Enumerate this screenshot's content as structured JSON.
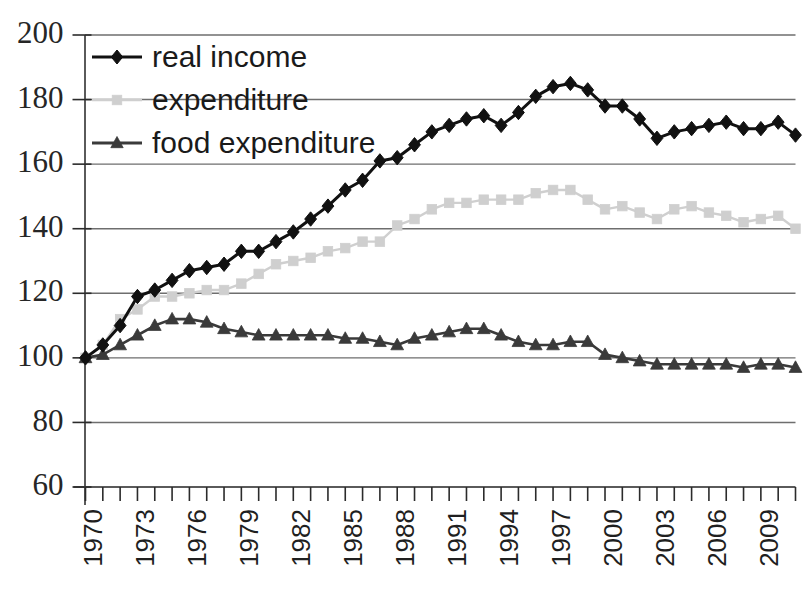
{
  "chart_data": {
    "type": "line",
    "title": "",
    "subtitle": "",
    "xlabel": "",
    "ylabel": "",
    "xlim": [
      1970,
      2011
    ],
    "ylim": [
      60,
      200
    ],
    "ytick_step": 20,
    "yticks": [
      60,
      80,
      100,
      120,
      140,
      160,
      180,
      200
    ],
    "ytick_labels": [
      "60",
      "80",
      "100",
      "120",
      "140",
      "160",
      "180",
      "200"
    ],
    "grid": true,
    "grid_axis": "y",
    "legend_position": "top-left",
    "x": [
      1970,
      1971,
      1972,
      1973,
      1974,
      1975,
      1976,
      1977,
      1978,
      1979,
      1980,
      1981,
      1982,
      1983,
      1984,
      1985,
      1986,
      1987,
      1988,
      1989,
      1990,
      1991,
      1992,
      1993,
      1994,
      1995,
      1996,
      1997,
      1998,
      1999,
      2000,
      2001,
      2002,
      2003,
      2004,
      2005,
      2006,
      2007,
      2008,
      2009,
      2010,
      2011
    ],
    "xticks": [
      1970,
      1971,
      1972,
      1973,
      1974,
      1975,
      1976,
      1977,
      1978,
      1979,
      1980,
      1981,
      1982,
      1983,
      1984,
      1985,
      1986,
      1987,
      1988,
      1989,
      1990,
      1991,
      1992,
      1993,
      1994,
      1995,
      1996,
      1997,
      1998,
      1999,
      2000,
      2001,
      2002,
      2003,
      2004,
      2005,
      2006,
      2007,
      2008,
      2009,
      2010,
      2011
    ],
    "xtick_labels_shown": [
      "1970",
      "1973",
      "1976",
      "1979",
      "1982",
      "1985",
      "1988",
      "1991",
      "1994",
      "1997",
      "2000",
      "2003",
      "2006",
      "2009"
    ],
    "xtick_label_interval": 3,
    "xtick_label_rotation": -90,
    "series": [
      {
        "name": "real income",
        "color": "#111111",
        "marker": "diamond",
        "values": [
          100,
          104,
          110,
          119,
          121,
          124,
          127,
          128,
          129,
          133,
          133,
          136,
          139,
          143,
          147,
          152,
          155,
          161,
          162,
          166,
          170,
          172,
          174,
          175,
          172,
          176,
          181,
          184,
          185,
          183,
          178,
          178,
          174,
          168,
          170,
          171,
          172,
          173,
          171,
          171,
          173,
          169
        ]
      },
      {
        "name": "expenditure",
        "color": "#cfcfcf",
        "marker": "square",
        "values": [
          100,
          104,
          112,
          115,
          119,
          119,
          120,
          121,
          121,
          123,
          126,
          129,
          130,
          131,
          133,
          134,
          136,
          136,
          141,
          143,
          146,
          148,
          148,
          149,
          149,
          149,
          151,
          152,
          152,
          149,
          146,
          147,
          145,
          143,
          146,
          147,
          145,
          144,
          142,
          143,
          144,
          140
        ]
      },
      {
        "name": "food expenditure",
        "color": "#3a3a3a",
        "marker": "triangle",
        "values": [
          100,
          101,
          104,
          107,
          110,
          112,
          112,
          111,
          109,
          108,
          107,
          107,
          107,
          107,
          107,
          106,
          106,
          105,
          104,
          106,
          107,
          108,
          109,
          109,
          107,
          105,
          104,
          104,
          105,
          105,
          101,
          100,
          99,
          98,
          98,
          98,
          98,
          98,
          97,
          98,
          98,
          97
        ]
      }
    ],
    "legend_entries": [
      {
        "label": "real income",
        "marker": "diamond",
        "color": "#111111"
      },
      {
        "label": "expenditure",
        "marker": "square",
        "color": "#cfcfcf"
      },
      {
        "label": "food expenditure",
        "marker": "triangle",
        "color": "#3a3a3a"
      }
    ]
  }
}
